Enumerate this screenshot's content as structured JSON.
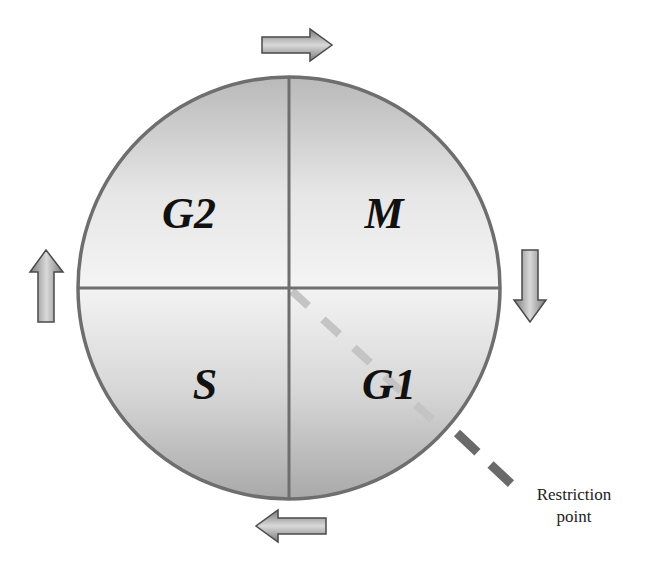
{
  "diagram": {
    "type": "cell-cycle",
    "phases": [
      {
        "id": "g2",
        "label": "G2",
        "quadrant": "top-left"
      },
      {
        "id": "m",
        "label": "M",
        "quadrant": "top-right"
      },
      {
        "id": "g1",
        "label": "G1",
        "quadrant": "bottom-right"
      },
      {
        "id": "s",
        "label": "S",
        "quadrant": "bottom-left"
      }
    ],
    "arrows": [
      {
        "id": "top",
        "direction": "right",
        "position": "top"
      },
      {
        "id": "right",
        "direction": "down",
        "position": "right"
      },
      {
        "id": "bottom",
        "direction": "left",
        "position": "bottom"
      },
      {
        "id": "left",
        "direction": "up",
        "position": "left"
      }
    ],
    "annotation": {
      "line1": "Restriction",
      "line2": "point"
    },
    "colors": {
      "circle_stroke": "#6e6e6e",
      "fill_light": "#f2f2f2",
      "fill_dark": "#a8a8a8",
      "dash_inside": "#c4c4c4",
      "dash_outside": "#6a6a6a",
      "label": "#111111"
    }
  }
}
